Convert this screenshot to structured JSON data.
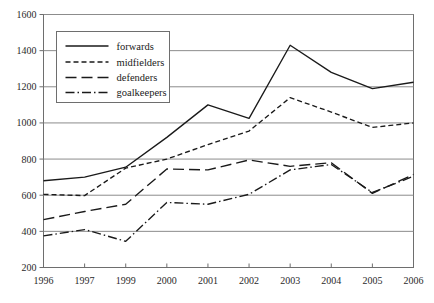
{
  "chart_data": {
    "type": "line",
    "title": "",
    "subtitle": "",
    "xlabel": "",
    "ylabel": "",
    "grid": true,
    "legend_position": "upper-left",
    "x": [
      "1996",
      "1997",
      "1999",
      "2000",
      "2001",
      "2002",
      "2003",
      "2004",
      "2005",
      "2006"
    ],
    "categories": [
      "1996",
      "1997",
      "1999",
      "2000",
      "2001",
      "2002",
      "2003",
      "2004",
      "2005",
      "2006"
    ],
    "ylim": [
      200,
      1600
    ],
    "yticks": [
      "200",
      "400",
      "600",
      "800",
      "1000",
      "1200",
      "1400",
      "1600"
    ],
    "ytick_values": [
      200,
      400,
      600,
      800,
      1000,
      1200,
      1400,
      1600
    ],
    "series": [
      {
        "name": "forwards",
        "style": "solid",
        "color": "#1a1a1a",
        "values": [
          680,
          700,
          755,
          920,
          1100,
          1025,
          1430,
          1280,
          1190,
          1225
        ]
      },
      {
        "name": "midfielders",
        "style": "short-dash",
        "color": "#1a1a1a",
        "values": [
          605,
          598,
          750,
          800,
          880,
          955,
          1140,
          1060,
          975,
          1000
        ]
      },
      {
        "name": "defenders",
        "style": "long-dash",
        "color": "#1a1a1a",
        "values": [
          465,
          510,
          550,
          745,
          740,
          795,
          760,
          780,
          610,
          715
        ]
      },
      {
        "name": "goalkeepers",
        "style": "dash-dot",
        "color": "#1a1a1a",
        "values": [
          375,
          410,
          345,
          560,
          550,
          605,
          740,
          770,
          615,
          705
        ]
      }
    ]
  },
  "legend": {
    "items": [
      {
        "label": "forwards"
      },
      {
        "label": "midfielders"
      },
      {
        "label": "defenders"
      },
      {
        "label": "goalkeepers"
      }
    ]
  },
  "colors": {
    "line": "#1a1a1a",
    "grid": "#8c8c8c",
    "axis": "#6e6e6e",
    "background": "#ffffff"
  }
}
